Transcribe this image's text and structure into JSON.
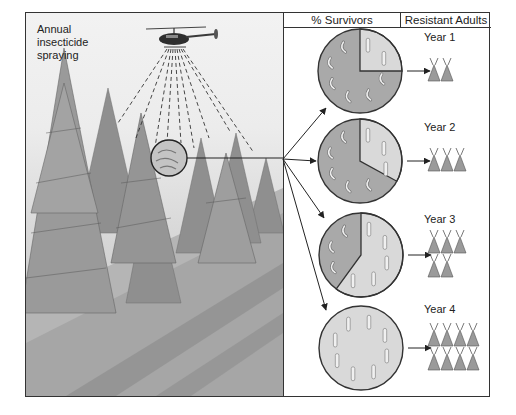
{
  "figure": {
    "spray_label_lines": [
      "Annual",
      "insecticide",
      "spraying"
    ],
    "headers": {
      "survivors": "% Survivors",
      "resistant": "Resistant Adults"
    },
    "years": [
      {
        "label": "Year 1",
        "resistant_fraction": 0.25,
        "moths": 2
      },
      {
        "label": "Year 2",
        "resistant_fraction": 0.33,
        "moths": 3
      },
      {
        "label": "Year 3",
        "resistant_fraction": 0.6,
        "moths": 5
      },
      {
        "label": "Year 4",
        "resistant_fraction": 1.0,
        "moths": 8
      }
    ],
    "colors": {
      "susceptible": "#a9a9a9",
      "resistant": "#d9d9d9",
      "line": "#333333"
    }
  }
}
